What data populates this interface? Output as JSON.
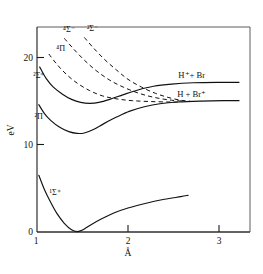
{
  "chart_data": {
    "type": "line",
    "title": "",
    "xlabel": "Å",
    "ylabel": "eV",
    "xlim": [
      0.95,
      3.25
    ],
    "ylim": [
      -0.6,
      24.5
    ],
    "xticks": [
      1,
      2,
      3
    ],
    "xtick_labels": [
      "1",
      "2",
      "3"
    ],
    "yticks": [
      0,
      10,
      20
    ],
    "ytick_labels": [
      "0",
      "10",
      "20"
    ],
    "grid": false,
    "legend_position": "inline-annotations",
    "series": [
      {
        "name": "1Sigma+",
        "label": "¹Σ⁺",
        "style": "solid",
        "points": [
          [
            1.02,
            6.5
          ],
          [
            1.08,
            4.9
          ],
          [
            1.15,
            3.4
          ],
          [
            1.22,
            2.1
          ],
          [
            1.3,
            1.0
          ],
          [
            1.38,
            0.25
          ],
          [
            1.44,
            0.05
          ],
          [
            1.5,
            0.22
          ],
          [
            1.58,
            0.75
          ],
          [
            1.7,
            1.45
          ],
          [
            1.85,
            2.2
          ],
          [
            2.0,
            2.75
          ],
          [
            2.2,
            3.3
          ],
          [
            2.4,
            3.75
          ],
          [
            2.58,
            4.05
          ],
          [
            2.66,
            4.2
          ]
        ]
      },
      {
        "name": "2Pi",
        "label": "²Π",
        "style": "solid",
        "points": [
          [
            1.02,
            14.6
          ],
          [
            1.08,
            13.6
          ],
          [
            1.15,
            12.8
          ],
          [
            1.25,
            12.0
          ],
          [
            1.35,
            11.5
          ],
          [
            1.44,
            11.3
          ],
          [
            1.52,
            11.35
          ],
          [
            1.62,
            11.75
          ],
          [
            1.74,
            12.45
          ],
          [
            1.88,
            13.2
          ],
          [
            2.02,
            13.85
          ],
          [
            2.18,
            14.35
          ],
          [
            2.35,
            14.7
          ],
          [
            2.55,
            14.9
          ],
          [
            2.8,
            15.0
          ],
          [
            3.05,
            15.05
          ],
          [
            3.22,
            15.05
          ]
        ]
      },
      {
        "name": "2Sigma+",
        "label": "²Σ⁺",
        "style": "solid",
        "points": [
          [
            1.03,
            18.9
          ],
          [
            1.1,
            17.6
          ],
          [
            1.18,
            16.6
          ],
          [
            1.28,
            15.8
          ],
          [
            1.38,
            15.2
          ],
          [
            1.48,
            14.85
          ],
          [
            1.58,
            14.75
          ],
          [
            1.68,
            14.85
          ],
          [
            1.8,
            15.2
          ],
          [
            1.95,
            15.75
          ],
          [
            2.1,
            16.25
          ],
          [
            2.28,
            16.7
          ],
          [
            2.48,
            16.95
          ],
          [
            2.72,
            17.1
          ],
          [
            3.0,
            17.15
          ],
          [
            3.22,
            17.15
          ]
        ]
      },
      {
        "name": "4Pi",
        "label": "⁴Π",
        "style": "dashed",
        "points": [
          [
            1.13,
            20.4
          ],
          [
            1.22,
            19.2
          ],
          [
            1.33,
            18.0
          ],
          [
            1.45,
            17.0
          ],
          [
            1.58,
            16.2
          ],
          [
            1.72,
            15.6
          ],
          [
            1.88,
            15.25
          ],
          [
            2.05,
            15.05
          ],
          [
            2.25,
            14.95
          ],
          [
            2.45,
            14.9
          ],
          [
            2.58,
            14.9
          ]
        ]
      },
      {
        "name": "4Sigma-",
        "label": "⁴Σ⁻",
        "style": "dashed",
        "points": [
          [
            1.3,
            22.2
          ],
          [
            1.4,
            21.0
          ],
          [
            1.52,
            19.7
          ],
          [
            1.65,
            18.5
          ],
          [
            1.8,
            17.4
          ],
          [
            1.95,
            16.6
          ],
          [
            2.12,
            15.9
          ],
          [
            2.3,
            15.4
          ],
          [
            2.48,
            15.1
          ],
          [
            2.62,
            15.0
          ]
        ]
      },
      {
        "name": "2Sigma-",
        "label": "²Σ⁻",
        "style": "dashed",
        "points": [
          [
            1.52,
            22.3
          ],
          [
            1.62,
            21.1
          ],
          [
            1.74,
            19.8
          ],
          [
            1.87,
            18.6
          ],
          [
            2.0,
            17.5
          ],
          [
            2.15,
            16.6
          ],
          [
            2.3,
            15.9
          ],
          [
            2.45,
            15.4
          ],
          [
            2.58,
            15.1
          ],
          [
            2.68,
            15.0
          ]
        ]
      }
    ],
    "asymptote_labels": [
      {
        "name": "upper",
        "text": "H⁺+ Br",
        "x": 2.7,
        "y": 17.15
      },
      {
        "name": "lower",
        "text": "H + Br⁺",
        "x": 2.7,
        "y": 15.05
      }
    ],
    "state_labels": [
      {
        "name": "2sigma-plus",
        "text": "²Σ⁺",
        "x": 1.02,
        "y": 17.6
      },
      {
        "name": "2pi",
        "text": "²Π",
        "x": 1.02,
        "y": 13.0
      },
      {
        "name": "1sigma-plus",
        "text": "¹Σ⁺",
        "x": 1.2,
        "y": 4.3
      },
      {
        "name": "4pi",
        "text": "⁴Π",
        "x": 1.26,
        "y": 20.7
      },
      {
        "name": "4sigma-minus",
        "text": "⁴Σ⁻",
        "x": 1.35,
        "y": 22.9
      },
      {
        "name": "2sigma-minus",
        "text": "²Σ⁻",
        "x": 1.61,
        "y": 23.0
      }
    ]
  },
  "axes": {
    "x_title": "Å",
    "y_title": "eV",
    "x_tick_labels": [
      "1",
      "2",
      "3"
    ],
    "y_tick_labels": [
      "0",
      "10",
      "20"
    ]
  },
  "colors": {
    "curve": "#111111",
    "axis": "#1a1a1a",
    "frame": "#4a4a4a",
    "background": "#ffffff"
  }
}
